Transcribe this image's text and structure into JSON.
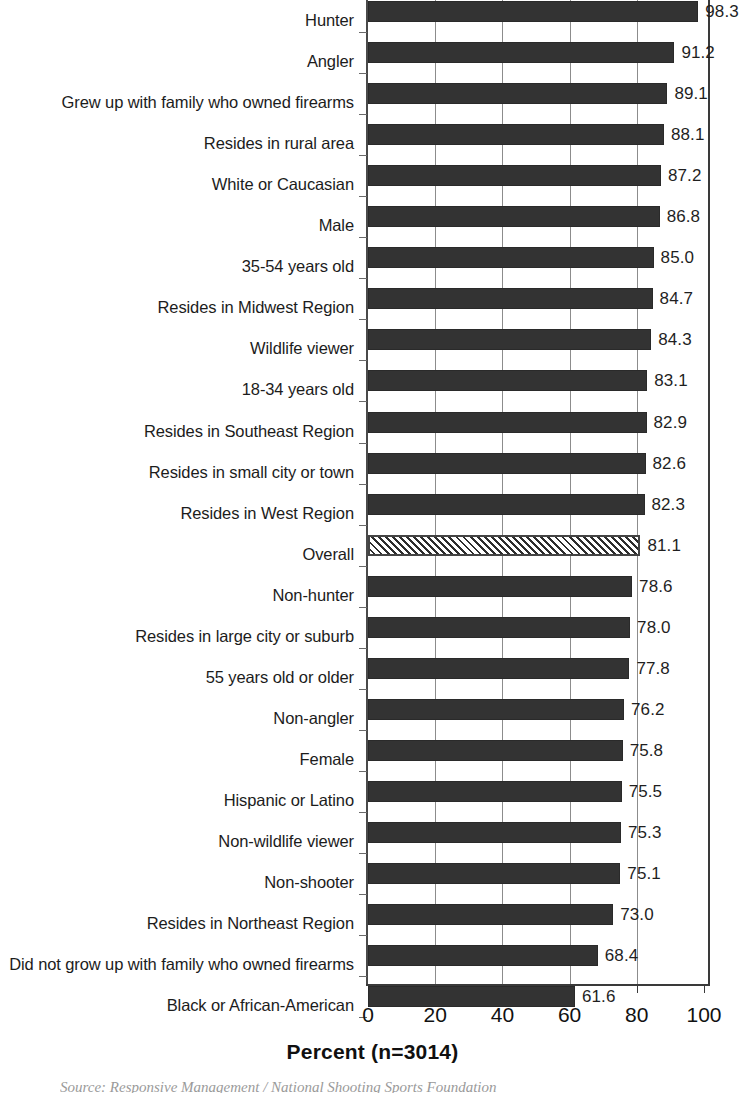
{
  "chart_data": {
    "type": "bar",
    "orientation": "horizontal",
    "title": "",
    "xlabel": "Percent (n=3014)",
    "ylabel": "",
    "xlim": [
      0,
      100
    ],
    "xticks": [
      "0",
      "20",
      "40",
      "60",
      "80",
      "100"
    ],
    "grid": true,
    "legend": null,
    "sample_size": "n=3014",
    "highlight_category": "Overall",
    "categories": [
      "Hunter",
      "Angler",
      "Grew up with family who owned firearms",
      "Resides in rural area",
      "White or Caucasian",
      "Male",
      "35-54 years old",
      "Resides in Midwest Region",
      "Wildlife viewer",
      "18-34 years old",
      "Resides in Southeast Region",
      "Resides in small city or town",
      "Resides in West Region",
      "Overall",
      "Non-hunter",
      "Resides in large city or suburb",
      "55 years old or older",
      "Non-angler",
      "Female",
      "Hispanic or Latino",
      "Non-wildlife viewer",
      "Non-shooter",
      "Resides in Northeast Region",
      "Did not grow up with family who owned firearms",
      "Black or African-American"
    ],
    "values": [
      98.3,
      91.2,
      89.1,
      88.1,
      87.2,
      86.8,
      85.0,
      84.7,
      84.3,
      83.1,
      82.9,
      82.6,
      82.3,
      81.1,
      78.6,
      78.0,
      77.8,
      76.2,
      75.8,
      75.5,
      75.3,
      75.1,
      73.0,
      68.4,
      61.6
    ],
    "value_labels": [
      "98.3",
      "91.2",
      "89.1",
      "88.1",
      "87.2",
      "86.8",
      "85.0",
      "84.7",
      "84.3",
      "83.1",
      "82.9",
      "82.6",
      "82.3",
      "81.1",
      "78.6",
      "78.0",
      "77.8",
      "76.2",
      "75.8",
      "75.5",
      "75.3",
      "75.1",
      "73.0",
      "68.4",
      "61.6"
    ],
    "colors": {
      "bar": "#333333",
      "highlight_bar_pattern": "diagonal-hatch",
      "highlight_bar_fill": "#ffffff",
      "gridline": "#8c8c8c",
      "axis": "#3a3a3a",
      "text": "#1c1c1c"
    }
  },
  "axis": {
    "x_title": "Percent (n=3014)"
  },
  "footer": {
    "source_note": "Source:  Responsive Management / National Shooting Sports Foundation"
  }
}
